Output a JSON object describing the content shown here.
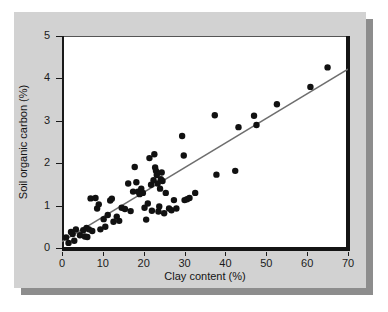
{
  "figure": {
    "background_color": "#d2d2d2",
    "plot_background_color": "#ffffff",
    "shadow_color": "#8d8d8d"
  },
  "chart_data": {
    "type": "scatter",
    "title": "",
    "xlabel": "Clay content (%)",
    "ylabel": "Soil organic carbon (%)",
    "xlim": [
      0,
      70
    ],
    "ylim": [
      0,
      5
    ],
    "xticks": [
      0,
      10,
      20,
      30,
      40,
      50,
      60,
      70
    ],
    "yticks": [
      0,
      1,
      2,
      3,
      4,
      5
    ],
    "xtick_labels": [
      "0",
      "10",
      "20",
      "30",
      "40",
      "50",
      "60",
      "70"
    ],
    "ytick_labels": [
      "0",
      "1",
      "2",
      "3",
      "4",
      "5"
    ],
    "grid": false,
    "legend": null,
    "marker_color": "#111111",
    "marker_size": 3.2,
    "trendline": {
      "type": "linear",
      "color": "#6e6e6e",
      "width": 1.6,
      "x": [
        0,
        70
      ],
      "y": [
        0.15,
        4.22
      ],
      "slope": 0.0581,
      "intercept": 0.15
    },
    "points": [
      [
        1.0,
        0.25
      ],
      [
        1.6,
        0.12
      ],
      [
        2.2,
        0.38
      ],
      [
        2.6,
        0.33
      ],
      [
        3.0,
        0.17
      ],
      [
        3.4,
        0.44
      ],
      [
        4.4,
        0.3
      ],
      [
        5.2,
        0.42
      ],
      [
        5.6,
        0.27
      ],
      [
        6.0,
        0.47
      ],
      [
        6.2,
        0.26
      ],
      [
        6.6,
        0.44
      ],
      [
        7.0,
        1.17
      ],
      [
        7.4,
        0.4
      ],
      [
        8.2,
        1.18
      ],
      [
        8.6,
        0.93
      ],
      [
        9.0,
        1.03
      ],
      [
        9.4,
        0.44
      ],
      [
        10.2,
        0.68
      ],
      [
        10.6,
        0.5
      ],
      [
        11.2,
        0.78
      ],
      [
        11.8,
        1.12
      ],
      [
        12.2,
        1.16
      ],
      [
        12.6,
        0.62
      ],
      [
        13.4,
        0.74
      ],
      [
        14.0,
        0.64
      ],
      [
        14.6,
        0.95
      ],
      [
        15.4,
        0.92
      ],
      [
        16.2,
        1.52
      ],
      [
        16.8,
        0.87
      ],
      [
        17.4,
        1.33
      ],
      [
        17.8,
        1.91
      ],
      [
        18.2,
        1.55
      ],
      [
        18.6,
        1.33
      ],
      [
        19.0,
        1.27
      ],
      [
        19.4,
        1.4
      ],
      [
        19.8,
        1.3
      ],
      [
        20.2,
        0.95
      ],
      [
        20.6,
        0.67
      ],
      [
        21.0,
        1.05
      ],
      [
        21.4,
        2.12
      ],
      [
        21.8,
        1.49
      ],
      [
        22.0,
        0.88
      ],
      [
        22.4,
        1.6
      ],
      [
        22.6,
        2.21
      ],
      [
        22.8,
        1.9
      ],
      [
        23.0,
        1.82
      ],
      [
        23.2,
        1.72
      ],
      [
        23.4,
        1.52
      ],
      [
        23.6,
        0.86
      ],
      [
        23.8,
        0.98
      ],
      [
        24.0,
        1.4
      ],
      [
        24.2,
        1.62
      ],
      [
        24.4,
        1.78
      ],
      [
        24.6,
        1.58
      ],
      [
        25.0,
        0.82
      ],
      [
        25.4,
        1.3
      ],
      [
        26.2,
        0.93
      ],
      [
        26.8,
        0.89
      ],
      [
        27.4,
        1.13
      ],
      [
        28.0,
        0.93
      ],
      [
        29.4,
        2.64
      ],
      [
        29.8,
        2.18
      ],
      [
        30.0,
        1.13
      ],
      [
        30.6,
        1.15
      ],
      [
        31.2,
        1.18
      ],
      [
        32.6,
        1.3
      ],
      [
        37.4,
        3.13
      ],
      [
        37.8,
        1.73
      ],
      [
        42.4,
        1.82
      ],
      [
        43.2,
        2.85
      ],
      [
        47.0,
        3.12
      ],
      [
        47.6,
        2.9
      ],
      [
        52.6,
        3.39
      ],
      [
        60.8,
        3.8
      ],
      [
        65.0,
        4.26
      ]
    ]
  }
}
